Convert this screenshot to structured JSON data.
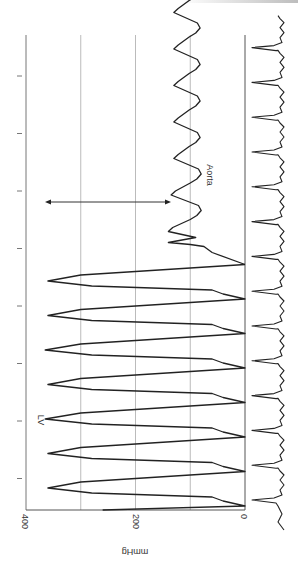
{
  "chart_data": {
    "type": "line",
    "orientation": "rotated-90-clockwise",
    "title": "",
    "ylabel": "mmHg",
    "xlabel": "",
    "ylim": [
      0,
      400
    ],
    "y_ticks": [
      0,
      200,
      400
    ],
    "y_tick_labels": [
      "0",
      "200",
      "400"
    ],
    "gridlines_at": [
      100,
      200,
      300,
      400
    ],
    "grid": true,
    "time_ticks_count": 8,
    "annotations": [
      {
        "text": "LV",
        "near_series": "LV"
      },
      {
        "text": "Aorta",
        "near_series": "Aorta"
      },
      {
        "type": "double-arrow",
        "from_mmHg": 360,
        "to_mmHg": 130,
        "description": "pressure gradient arrow between LV peak level and aortic pressure"
      }
    ],
    "series": [
      {
        "name": "LV",
        "unit": "mmHg",
        "beats": [
          {
            "t": 0.0,
            "peak": 360,
            "end_diastolic": 0
          },
          {
            "t": 1.0,
            "peak": 360,
            "end_diastolic": 0
          },
          {
            "t": 2.0,
            "peak": 365,
            "end_diastolic": 0
          },
          {
            "t": 3.0,
            "peak": 360,
            "end_diastolic": 0
          },
          {
            "t": 4.0,
            "peak": 365,
            "end_diastolic": 0
          },
          {
            "t": 5.0,
            "peak": 360,
            "end_diastolic": 0
          },
          {
            "t": 6.0,
            "peak": 360,
            "end_diastolic": 0
          }
        ],
        "typical_systolic": 360,
        "typical_diastolic": 0
      },
      {
        "name": "Aorta",
        "unit": "mmHg",
        "beats": [
          {
            "t": 7.0,
            "systolic": 140,
            "diastolic": 80
          },
          {
            "t": 8.0,
            "systolic": 135,
            "diastolic": 80
          },
          {
            "t": 9.0,
            "systolic": 130,
            "diastolic": 82
          },
          {
            "t": 10.0,
            "systolic": 130,
            "diastolic": 82
          },
          {
            "t": 11.0,
            "systolic": 130,
            "diastolic": 82
          },
          {
            "t": 12.0,
            "systolic": 130,
            "diastolic": 82
          },
          {
            "t": 13.0,
            "systolic": 130,
            "diastolic": 82
          }
        ],
        "typical_systolic": 130,
        "typical_diastolic": 80
      },
      {
        "name": "ECG",
        "unit": "",
        "qrs_count": 14
      }
    ]
  },
  "labels": {
    "axis_title": "mmHg",
    "tick_0": "0",
    "tick_200": "200",
    "tick_400": "400",
    "lv": "LV",
    "aorta": "Aorta"
  }
}
